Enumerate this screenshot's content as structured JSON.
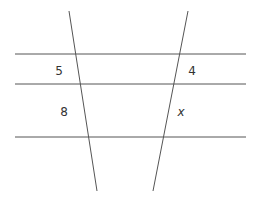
{
  "diagram": {
    "line_color": "#555555",
    "label_color": "#333333",
    "parallel_lines": [
      {
        "x1": 15,
        "y1": 54,
        "x2": 246,
        "y2": 54
      },
      {
        "x1": 15,
        "y1": 84,
        "x2": 246,
        "y2": 84
      },
      {
        "x1": 15,
        "y1": 137,
        "x2": 246,
        "y2": 137
      }
    ],
    "transversals": [
      {
        "name": "left",
        "x1": 69,
        "y1": 11,
        "x2": 97,
        "y2": 191
      },
      {
        "name": "right",
        "x1": 188,
        "y1": 11,
        "x2": 153,
        "y2": 191
      }
    ],
    "labels": {
      "left_top": {
        "text": "5",
        "x": 59,
        "y": 75
      },
      "left_bottom": {
        "text": "8",
        "x": 64,
        "y": 116
      },
      "right_top": {
        "text": "4",
        "x": 192,
        "y": 75
      },
      "right_bottom": {
        "text": "x",
        "x": 181,
        "y": 116
      }
    }
  }
}
